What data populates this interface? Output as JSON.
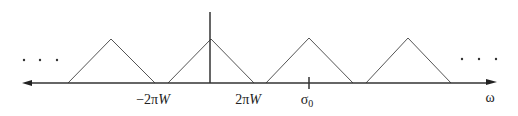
{
  "diagram": {
    "type": "periodic-spectrum",
    "axis": {
      "label": "ω",
      "y": 83,
      "x_start": 22,
      "x_end": 496,
      "color": "#333333"
    },
    "ellipsis_left": "· · ·",
    "ellipsis_right": "· · ·",
    "tick_labels": [
      {
        "text_prefix": "−2π",
        "text_var": "W",
        "x": 153
      },
      {
        "text_prefix": "2π",
        "text_var": "W",
        "x": 248
      }
    ],
    "marker": {
      "label": "σ",
      "subscript": "0",
      "x": 309
    },
    "origin_line": {
      "x": 210,
      "y_top": 12
    },
    "triangles": [
      {
        "left": 68,
        "peak_x": 111,
        "right": 155,
        "peak_y": 39
      },
      {
        "left": 168,
        "peak_x": 211,
        "right": 254,
        "peak_y": 39
      },
      {
        "left": 266,
        "peak_x": 309,
        "right": 353,
        "peak_y": 38
      },
      {
        "left": 366,
        "peak_x": 408,
        "right": 451,
        "peak_y": 38
      }
    ],
    "line_color": "#555555"
  }
}
